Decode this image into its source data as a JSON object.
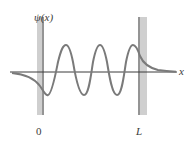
{
  "figure": {
    "y_axis_label": "ψ(x)",
    "x_axis_label": "x",
    "tick_labels": {
      "left_wall": "0",
      "right_wall": "L"
    }
  },
  "colors": {
    "curve": "#7a7a7a",
    "axis": "#3a3a3a",
    "wall_fill": "#cfcfcf",
    "wall_edge": "#5a5a5a",
    "text": "#3a3a3a",
    "background": "#ffffff"
  },
  "diagram": {
    "type": "wavefunction-in-finite-well",
    "wall_positions": [
      "0",
      "L"
    ],
    "antinodes_inside_well": 6,
    "peaks_above_axis": 3,
    "troughs_below_axis": 3,
    "exterior_behavior": "exponential decay outside both walls"
  }
}
